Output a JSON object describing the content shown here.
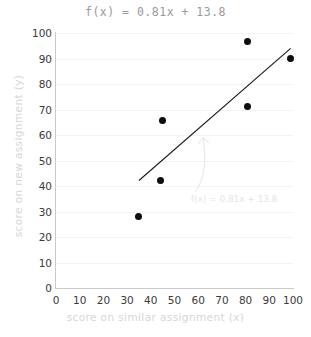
{
  "chart_data": {
    "type": "scatter",
    "title": "f(x) = 0.81x + 13.8",
    "xlabel": "score on similar assignment (x)",
    "ylabel": "score on new assignment (y)",
    "xlim": [
      0,
      100
    ],
    "ylim": [
      0,
      100
    ],
    "xticks": [
      0,
      10,
      20,
      30,
      40,
      50,
      60,
      70,
      80,
      90,
      100
    ],
    "yticks": [
      0,
      10,
      20,
      30,
      40,
      50,
      60,
      70,
      80,
      90,
      100
    ],
    "grid": "horizontal-faint",
    "legend": "none",
    "points": [
      {
        "x": 35,
        "y": 28
      },
      {
        "x": 44,
        "y": 42
      },
      {
        "x": 45,
        "y": 65.5
      },
      {
        "x": 81,
        "y": 71
      },
      {
        "x": 81,
        "y": 96.5
      },
      {
        "x": 99,
        "y": 90
      }
    ],
    "series": [
      {
        "name": "data points",
        "x": [
          35,
          44,
          45,
          81,
          81,
          99
        ],
        "values": [
          28,
          42,
          65.5,
          71,
          96.5,
          90
        ],
        "marker": "filled-circle",
        "color": "#0d0d0d"
      },
      {
        "name": "regression line",
        "type": "line",
        "equation": "f(x) = 0.81x + 13.8",
        "slope": 0.81,
        "intercept": 13.8,
        "x": [
          35,
          99
        ],
        "values": [
          42.15,
          94.0
        ],
        "color": "#1a1a1a"
      }
    ],
    "annotations": [
      {
        "text": "f(x) = 0.81x + 13.8",
        "x": 57,
        "y": 35,
        "color": "#e6e4e4",
        "arrow_to": {
          "x": 62,
          "y": 59
        }
      }
    ],
    "colors": {
      "point": "#0d0d0d",
      "line": "#1a1a1a",
      "title": "#9a9a9a",
      "axis_label": "#d8d6d6",
      "tick": "#3b3b3b",
      "grid": "#f4f2f2",
      "spine": "#c9c9c9",
      "annotation": "#e6e4e4",
      "background": "#ffffff"
    }
  }
}
